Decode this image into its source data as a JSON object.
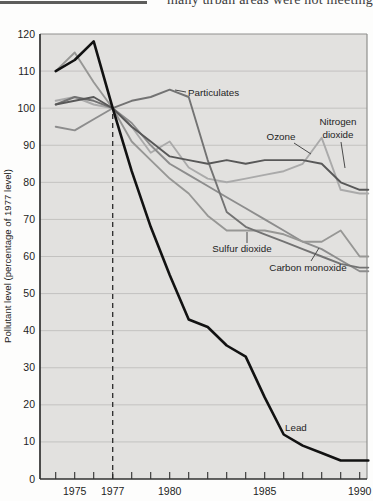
{
  "page": {
    "top_fragment_text": "many urban areas were not meeting"
  },
  "chart_data": {
    "type": "line",
    "title": "",
    "xlabel": "",
    "ylabel": "Pollutant level (percentage of 1977 level)",
    "grid": true,
    "xlim": [
      1974,
      1990.45
    ],
    "ylim": [
      0,
      120
    ],
    "x": [
      1974,
      1975,
      1976,
      1977,
      1978,
      1979,
      1980,
      1981,
      1982,
      1983,
      1984,
      1985,
      1986,
      1987,
      1988,
      1989,
      1990
    ],
    "x_tick_labels": [
      1975,
      1977,
      1980,
      1985,
      1990
    ],
    "y_ticks": [
      0,
      10,
      20,
      30,
      40,
      50,
      60,
      70,
      80,
      90,
      100,
      110,
      120
    ],
    "reference_line": {
      "x": 1977,
      "style": "dashed",
      "meaning": "baseline year (index = 100)"
    },
    "background_color": "#e2e1df",
    "gridline_color": "#c3c2c0",
    "series": [
      {
        "name": "Ozone",
        "color": "#aaaaaa",
        "width": 1.9,
        "values": [
          102,
          103,
          101,
          100,
          95,
          88,
          91,
          84,
          81,
          80,
          81,
          82,
          83,
          85,
          92,
          78,
          77
        ]
      },
      {
        "name": "Carbon monoxide",
        "color": "#8d8d8d",
        "width": 1.9,
        "values": [
          95,
          94,
          97,
          100,
          96,
          90,
          85,
          82,
          79,
          76,
          73,
          70,
          67,
          64,
          62,
          59,
          56
        ]
      },
      {
        "name": "Sulfur dioxide",
        "color": "#979795",
        "width": 1.9,
        "values": [
          110,
          115,
          107,
          100,
          91,
          86,
          81,
          77,
          71,
          67,
          67,
          67,
          66,
          64,
          64,
          67,
          60
        ]
      },
      {
        "name": "Particulates",
        "color": "#737373",
        "width": 1.9,
        "values": [
          101,
          103,
          102,
          100,
          102,
          103,
          105,
          103,
          86,
          72,
          68,
          66,
          64,
          62,
          60,
          58,
          57
        ]
      },
      {
        "name": "Nitrogen dioxide",
        "color": "#585858",
        "width": 1.9,
        "values": [
          101,
          102,
          103,
          100,
          95,
          91,
          87,
          86,
          85,
          86,
          85,
          86,
          86,
          86,
          85,
          80,
          78
        ]
      },
      {
        "name": "Lead",
        "color": "#121212",
        "width": 2.6,
        "values": [
          110,
          113,
          118,
          100,
          83,
          68,
          55,
          43,
          41,
          36,
          33,
          22,
          12,
          9,
          7,
          5,
          5
        ]
      }
    ]
  }
}
